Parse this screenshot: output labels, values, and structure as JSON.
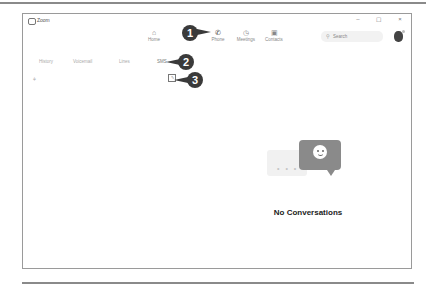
{
  "window": {
    "title": "Zoom",
    "controls": {
      "minimize": "–",
      "maximize": "☐",
      "close": "×"
    }
  },
  "topnav": {
    "items": [
      {
        "label": "Home",
        "icon": "home-icon",
        "glyph": "⌂"
      },
      {
        "label": "Phone",
        "icon": "phone-icon",
        "glyph": "✆",
        "active": true
      },
      {
        "label": "Meetings",
        "icon": "clock-icon",
        "glyph": "◷"
      },
      {
        "label": "Contacts",
        "icon": "contacts-icon",
        "glyph": "▣"
      }
    ],
    "search": {
      "placeholder": "Search",
      "icon": "⚲"
    }
  },
  "tabs": [
    {
      "label": "History"
    },
    {
      "label": "Voicemail"
    },
    {
      "label": "Lines"
    },
    {
      "label": "SMS",
      "active": true
    }
  ],
  "toolbar": {
    "filter_glyph": "⫩",
    "compose_glyph": "✎"
  },
  "callouts": [
    "1",
    "2",
    "3"
  ],
  "empty_state": {
    "title": "No Conversations",
    "dots": "• • •"
  },
  "colors": {
    "callout": "#3a3a3a",
    "bubble": "#8a8a8a"
  }
}
